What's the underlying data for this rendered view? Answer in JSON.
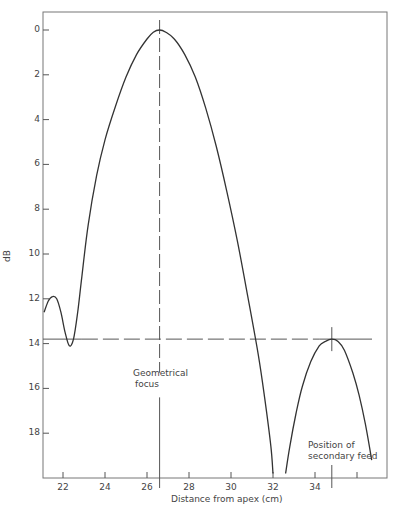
{
  "chart_data": {
    "type": "line",
    "title": "",
    "xlabel": "Distance from apex (cm)",
    "ylabel": "dB",
    "xlim": [
      21.1,
      37.5
    ],
    "ylim": [
      0,
      19.8
    ],
    "y_inverted": true,
    "x_ticks": [
      22,
      24,
      26,
      28,
      30,
      32,
      34,
      36
    ],
    "x_tick_labels": [
      "22",
      "24",
      "26",
      "28",
      "30",
      "32",
      "34",
      ""
    ],
    "y_ticks": [
      0,
      2,
      4,
      6,
      8,
      10,
      12,
      14,
      16,
      18
    ],
    "y_tick_labels": [
      "0",
      "2",
      "4",
      "6",
      "8",
      "10",
      "12",
      "14",
      "16",
      "18"
    ],
    "grid": false,
    "legend": null,
    "series": [
      {
        "name": "Left sidelobe and main lobe",
        "x": [
          21.1,
          21.3,
          21.5,
          21.7,
          21.9,
          22.1,
          22.3,
          22.5,
          22.7,
          22.9,
          23.2,
          23.6,
          24.0,
          24.5,
          25.0,
          25.5,
          26.0,
          26.3,
          26.6,
          26.9,
          27.3,
          27.8,
          28.3,
          28.8,
          29.3,
          29.8,
          30.3,
          30.8,
          31.3,
          31.6,
          31.9,
          32.0
        ],
        "y": [
          12.6,
          12.1,
          11.9,
          12.0,
          12.6,
          13.5,
          14.1,
          13.8,
          12.6,
          11.0,
          8.7,
          6.5,
          4.9,
          3.4,
          2.1,
          1.1,
          0.4,
          0.1,
          0.0,
          0.1,
          0.4,
          1.1,
          2.1,
          3.5,
          5.2,
          7.2,
          9.4,
          11.9,
          14.5,
          16.4,
          18.6,
          19.8
        ]
      },
      {
        "name": "Secondary lobe",
        "x": [
          32.6,
          32.8,
          33.1,
          33.4,
          33.8,
          34.2,
          34.5,
          34.8,
          35.1,
          35.4,
          35.8,
          36.1,
          36.4,
          36.7
        ],
        "y": [
          19.8,
          18.6,
          17.1,
          15.9,
          14.8,
          14.1,
          13.9,
          13.8,
          13.9,
          14.3,
          15.3,
          16.3,
          17.6,
          19.2
        ]
      }
    ],
    "reference_lines": [
      {
        "type": "vertical",
        "x": 26.6,
        "style": "dash",
        "label": "Geometrical focus"
      },
      {
        "type": "horizontal",
        "y": 13.8,
        "style": "dash"
      },
      {
        "type": "vertical-marker",
        "x": 34.8,
        "y": 13.8,
        "label": "Position of secondary feed"
      }
    ],
    "annotations": [
      {
        "text": "Geometrical focus",
        "x": 26.2,
        "y": 15.3
      },
      {
        "text": "Position of secondary feed",
        "x": 33.9,
        "y": 18.5
      }
    ]
  },
  "labels": {
    "ylabel": "dB",
    "xlabel": "Distance from apex (cm)",
    "focus_line1": "Geometrical",
    "focus_line2": "focus",
    "feed_line1": "Position of",
    "feed_line2": "secondary feed"
  }
}
